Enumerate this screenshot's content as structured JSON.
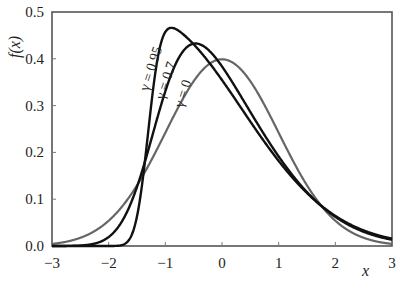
{
  "chart_data": {
    "type": "line",
    "title": "",
    "xlabel": "x",
    "ylabel": "f(x)",
    "xlim": [
      -3,
      3
    ],
    "ylim": [
      0,
      0.5
    ],
    "grid": false,
    "legend": "inline labels on curves",
    "x_ticks": [
      "−3",
      "−2",
      "−1",
      "0",
      "1",
      "2",
      "3"
    ],
    "x_tick_values": [
      -3,
      -2,
      -1,
      0,
      1,
      2,
      3
    ],
    "y_ticks": [
      "0.0",
      "0.1",
      "0.2",
      "0.3",
      "0.4",
      "0.5"
    ],
    "y_tick_values": [
      0,
      0.1,
      0.2,
      0.3,
      0.4,
      0.5
    ],
    "series": [
      {
        "name": "γ = 0.95",
        "gamma": 0.95,
        "color": "#111111",
        "peak": {
          "x": -0.97,
          "y": 0.464
        },
        "label_pos": {
          "x": 155,
          "y": 70
        },
        "approx_points": [
          [
            -1.8,
            0.0
          ],
          [
            -1.6,
            0.02
          ],
          [
            -1.4,
            0.15
          ],
          [
            -1.2,
            0.36
          ],
          [
            -1.0,
            0.46
          ],
          [
            -0.8,
            0.46
          ],
          [
            -0.5,
            0.43
          ],
          [
            0.0,
            0.35
          ],
          [
            0.5,
            0.25
          ],
          [
            1.0,
            0.16
          ],
          [
            1.5,
            0.11
          ],
          [
            2.0,
            0.065
          ],
          [
            2.5,
            0.035
          ],
          [
            3.0,
            0.018
          ]
        ]
      },
      {
        "name": "γ = 0.7",
        "gamma": 0.7,
        "color": "#111111",
        "peak": {
          "x": -0.51,
          "y": 0.434
        },
        "label_pos": {
          "x": 170,
          "y": 82
        },
        "approx_points": [
          [
            -3.0,
            0.0
          ],
          [
            -2.0,
            0.005
          ],
          [
            -1.5,
            0.1
          ],
          [
            -1.2,
            0.23
          ],
          [
            -1.0,
            0.33
          ],
          [
            -0.5,
            0.434
          ],
          [
            0.0,
            0.38
          ],
          [
            0.5,
            0.29
          ],
          [
            1.0,
            0.19
          ],
          [
            1.5,
            0.12
          ],
          [
            2.0,
            0.065
          ],
          [
            2.5,
            0.033
          ],
          [
            3.0,
            0.016
          ]
        ]
      },
      {
        "name": "γ = 0",
        "gamma": 0,
        "color": "#666666",
        "peak": {
          "x": 0.0,
          "y": 0.399
        },
        "label_pos": {
          "x": 187,
          "y": 95
        },
        "approx_points": [
          [
            -3.0,
            0.004
          ],
          [
            -2.0,
            0.054
          ],
          [
            -1.5,
            0.13
          ],
          [
            -1.0,
            0.242
          ],
          [
            -0.5,
            0.352
          ],
          [
            0.0,
            0.399
          ],
          [
            0.5,
            0.352
          ],
          [
            1.0,
            0.242
          ],
          [
            1.5,
            0.13
          ],
          [
            2.0,
            0.054
          ],
          [
            2.5,
            0.018
          ],
          [
            3.0,
            0.004
          ]
        ]
      }
    ]
  }
}
